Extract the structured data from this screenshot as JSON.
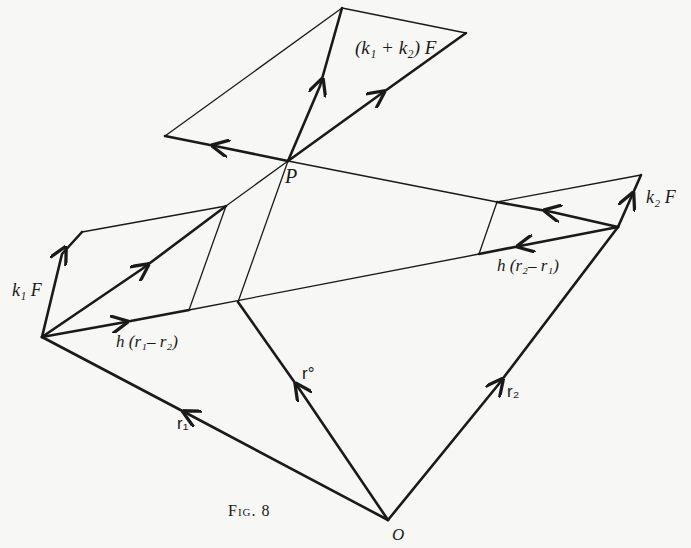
{
  "figure": {
    "caption": "Fig. 8",
    "points": {
      "P": "P",
      "O": "O"
    },
    "labels": {
      "k1k2F": "(k₁ + k₂) F",
      "k1F": "k₁ F",
      "k2F": "k₂ F",
      "h_r1_r2": "h (r₁– r₂)",
      "h_r2_r1": "h (r₂– r₁)",
      "r0": "r°",
      "r1": "r₁",
      "r2": "r₂"
    },
    "colors": {
      "ink": "#1a1a1a",
      "paper": "#f7f7f5"
    }
  }
}
